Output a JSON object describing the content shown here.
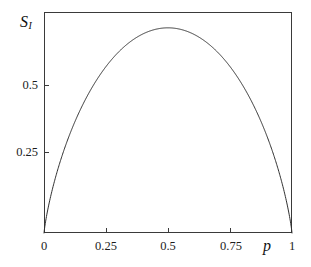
{
  "chart_data": {
    "type": "line",
    "title": "",
    "subtitle": "",
    "xlabel": "p",
    "ylabel": "S_I",
    "ylabel_base": "S",
    "ylabel_sub": "I",
    "xlim": [
      0,
      1
    ],
    "ylim": [
      0,
      0.7466
    ],
    "grid": false,
    "legend": null,
    "annotations": [],
    "xticks": [
      0,
      0.25,
      0.5,
      0.75,
      1
    ],
    "xticklabels": [
      "0",
      "0.25",
      "0.5",
      "0.75",
      "1"
    ],
    "yticks": [
      0.25,
      0.5
    ],
    "yticklabels": [
      "0.25",
      "0.5"
    ],
    "series": [
      {
        "name": "binary entropy",
        "formula": "S_I = -p*ln(p) - (1-p)*ln(1-p)",
        "peak": {
          "x": 0.5,
          "y": 0.6931
        },
        "x": [
          0,
          0.005,
          0.01,
          0.02,
          0.03,
          0.04,
          0.05,
          0.06,
          0.07,
          0.08,
          0.09,
          0.1,
          0.12,
          0.14,
          0.16,
          0.18,
          0.2,
          0.22,
          0.24,
          0.26,
          0.28,
          0.3,
          0.32,
          0.34,
          0.36,
          0.38,
          0.4,
          0.42,
          0.44,
          0.46,
          0.48,
          0.5,
          0.52,
          0.54,
          0.56,
          0.58,
          0.6,
          0.62,
          0.64,
          0.66,
          0.68,
          0.7,
          0.72,
          0.74,
          0.76,
          0.78,
          0.8,
          0.82,
          0.84,
          0.86,
          0.88,
          0.9,
          0.91,
          0.92,
          0.93,
          0.94,
          0.95,
          0.96,
          0.97,
          0.98,
          0.99,
          0.995,
          1
        ],
        "y": [
          0,
          0.0315,
          0.056,
          0.0983,
          0.1367,
          0.1724,
          0.206,
          0.2379,
          0.2684,
          0.2976,
          0.3257,
          0.3251,
          0.3712,
          0.4101,
          0.4463,
          0.48,
          0.5004,
          0.527,
          0.5513,
          0.5732,
          0.5929,
          0.6109,
          0.6269,
          0.6411,
          0.6534,
          0.664,
          0.673,
          0.6802,
          0.6858,
          0.6898,
          0.6923,
          0.6931,
          0.6923,
          0.6898,
          0.6858,
          0.6802,
          0.673,
          0.664,
          0.6534,
          0.6411,
          0.6269,
          0.6109,
          0.5929,
          0.5732,
          0.5513,
          0.527,
          0.5004,
          0.471,
          0.4463,
          0.4101,
          0.3712,
          0.3251,
          0.302,
          0.2774,
          0.2513,
          0.2279,
          0.1985,
          0.1671,
          0.1354,
          0.0983,
          0.056,
          0.0315,
          0
        ]
      }
    ],
    "colors": {
      "curve": "#2f2f2f",
      "frame": "#3a3a3a",
      "background": "#ffffff",
      "text": "#1c1c1c"
    }
  },
  "axes": {
    "y_ticks": [
      {
        "label": "0.5",
        "value": 0.5
      },
      {
        "label": "0.25",
        "value": 0.25
      }
    ],
    "x_ticks": [
      {
        "label": "0",
        "value": 0
      },
      {
        "label": "0.25",
        "value": 0.25
      },
      {
        "label": "0.5",
        "value": 0.5
      },
      {
        "label": "0.75",
        "value": 0.75
      },
      {
        "label": "1",
        "value": 1
      }
    ]
  }
}
